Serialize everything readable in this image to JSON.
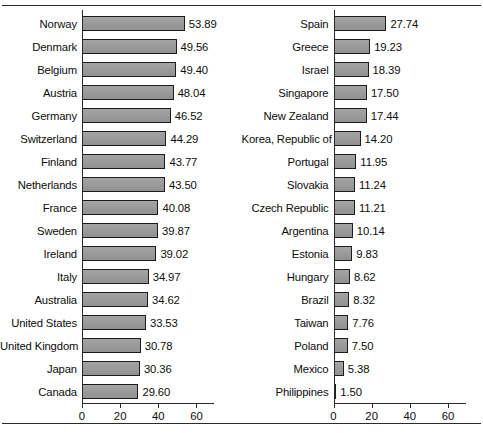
{
  "chart_data": {
    "type": "bar",
    "orientation": "horizontal",
    "title": "",
    "xlabel": "",
    "ylabel": "",
    "xlim": [
      0,
      65
    ],
    "xticks": [
      0,
      20,
      40,
      60
    ],
    "grid": false,
    "legend": null,
    "panels": [
      {
        "name": "left-panel",
        "categories": [
          "Norway",
          "Denmark",
          "Belgium",
          "Austria",
          "Germany",
          "Switzerland",
          "Finland",
          "Netherlands",
          "France",
          "Sweden",
          "Ireland",
          "Italy",
          "Australia",
          "United States",
          "United Kingdom",
          "Japan",
          "Canada"
        ],
        "values": [
          53.89,
          49.56,
          49.4,
          48.04,
          46.52,
          44.29,
          43.77,
          43.5,
          40.08,
          39.87,
          39.02,
          34.97,
          34.62,
          33.53,
          30.78,
          30.36,
          29.6
        ],
        "value_labels": [
          "53.89",
          "49.56",
          "49.40",
          "48.04",
          "46.52",
          "44.29",
          "43.77",
          "43.50",
          "40.08",
          "39.87",
          "39.02",
          "34.97",
          "34.62",
          "33.53",
          "30.78",
          "30.36",
          "29.60"
        ],
        "axis_tick_labels": [
          "0",
          "20",
          "40",
          "60"
        ]
      },
      {
        "name": "right-panel",
        "categories": [
          "Spain",
          "Greece",
          "Israel",
          "Singapore",
          "New Zealand",
          "Korea, Republic of",
          "Portugal",
          "Slovakia",
          "Czech Republic",
          "Argentina",
          "Estonia",
          "Hungary",
          "Brazil",
          "Taiwan",
          "Poland",
          "Mexico",
          "Philippines"
        ],
        "values": [
          27.74,
          19.23,
          18.39,
          17.5,
          17.44,
          14.2,
          11.95,
          11.24,
          11.21,
          10.14,
          9.83,
          8.62,
          8.32,
          7.76,
          7.5,
          5.38,
          1.5
        ],
        "value_labels": [
          "27.74",
          "19.23",
          "18.39",
          "17.50",
          "17.44",
          "14.20",
          "11.95",
          "11.24",
          "11.21",
          "10.14",
          "9.83",
          "8.62",
          "8.32",
          "7.76",
          "7.50",
          "5.38",
          "1.50"
        ],
        "axis_tick_labels": [
          "0",
          "20",
          "40",
          "60"
        ]
      }
    ],
    "colors": {
      "bar_fill": "#9a9a9a",
      "bar_border": "#1c1c1c",
      "axis": "#2b2b2b",
      "text": "#0d0d0d",
      "background": "#ffffff"
    }
  }
}
